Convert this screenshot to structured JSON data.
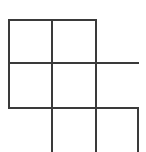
{
  "figure": {
    "width": 146,
    "height": 152,
    "background_color": "#ffffff",
    "stroke_color": "#3a3a3a",
    "stroke_width": 2
  },
  "chart_data": {
    "type": "line",
    "xlabel": "",
    "ylabel": "",
    "xlim": [
      0,
      146
    ],
    "ylim": [
      0,
      152
    ],
    "grid": false,
    "legend_position": "none",
    "segments": [
      {
        "name": "horizontal-top",
        "orientation": "horizontal",
        "x1": 8,
        "y1": 20,
        "x2": 97,
        "y2": 20
      },
      {
        "name": "horizontal-middle",
        "orientation": "horizontal",
        "x1": 8,
        "y1": 63,
        "x2": 139,
        "y2": 63
      },
      {
        "name": "horizontal-lower",
        "orientation": "horizontal",
        "x1": 8,
        "y1": 108,
        "x2": 139,
        "y2": 108
      },
      {
        "name": "vertical-left",
        "orientation": "vertical",
        "x1": 9,
        "y1": 20,
        "x2": 9,
        "y2": 108
      },
      {
        "name": "vertical-center-left",
        "orientation": "vertical",
        "x1": 52,
        "y1": 20,
        "x2": 52,
        "y2": 152
      },
      {
        "name": "vertical-center-right",
        "orientation": "vertical",
        "x1": 96,
        "y1": 20,
        "x2": 96,
        "y2": 152
      },
      {
        "name": "vertical-right",
        "orientation": "vertical",
        "x1": 138,
        "y1": 108,
        "x2": 138,
        "y2": 152
      }
    ]
  }
}
